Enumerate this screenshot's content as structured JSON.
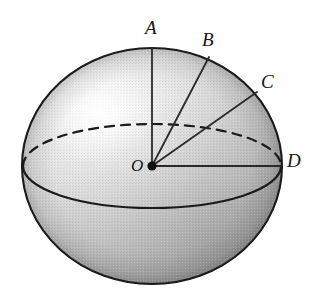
{
  "figure": {
    "name": "sphere-with-radii",
    "background_color": "#ffffff",
    "outline_color": "#1a1a1a",
    "line_color": "#2a2a2a",
    "fill_light": "#f2f2f2",
    "fill_mid": "#cfcfcf",
    "fill_dark": "#9a9a9a",
    "sphere": {
      "center_x": 152,
      "center_y": 166,
      "radius_x": 130,
      "radius_y": 118
    },
    "equator": {
      "center_x": 152,
      "center_y": 166,
      "radius_x": 129,
      "radius_y": 42,
      "back_half_style": "dashed",
      "front_half_style": "solid"
    },
    "center_point": {
      "label": "O",
      "x": 152,
      "y": 166,
      "dot_radius": 4.5
    },
    "radii": [
      {
        "label": "A",
        "end_x": 152,
        "end_y": 48
      },
      {
        "label": "B",
        "end_x": 209,
        "end_y": 57
      },
      {
        "label": "C",
        "end_x": 257,
        "end_y": 92
      },
      {
        "label": "D",
        "end_x": 281,
        "end_y": 166
      }
    ],
    "labels": {
      "A": "A",
      "B": "B",
      "C": "C",
      "D": "D",
      "O": "O"
    }
  }
}
